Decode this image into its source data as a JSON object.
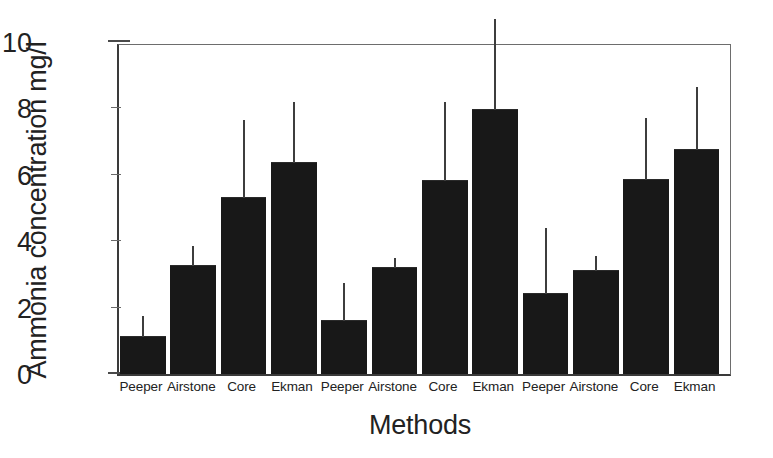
{
  "chart_data": {
    "type": "bar",
    "title": "",
    "xlabel": "Methods",
    "ylabel": "Ammonia concentration mg/l",
    "ylim": [
      0,
      10
    ],
    "ytick_values": [
      0,
      2,
      4,
      6,
      8,
      10
    ],
    "ytick_labels": [
      "0",
      "2",
      "4",
      "6",
      "8",
      "10"
    ],
    "grid": false,
    "legend": "none",
    "categories": [
      "Peeper",
      "Airstone",
      "Core",
      "Ekman",
      "Peeper",
      "Airstone",
      "Core",
      "Ekman",
      "Peeper",
      "Airstone",
      "Core",
      "Ekman"
    ],
    "values": [
      1.1,
      3.25,
      5.3,
      6.35,
      1.6,
      3.2,
      5.8,
      7.95,
      2.4,
      3.1,
      5.85,
      6.75
    ],
    "error_upper": [
      1.75,
      3.85,
      7.65,
      8.2,
      2.75,
      3.5,
      8.2,
      10.7,
      4.4,
      3.55,
      7.7,
      8.65
    ],
    "bar_color": "#181818",
    "error_bar_color": "#3d3d3d",
    "axis_color": "#3a3a3a"
  }
}
